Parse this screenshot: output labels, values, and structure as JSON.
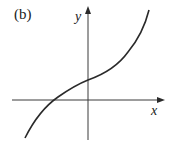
{
  "figure": {
    "panel_label": "(b)",
    "axes": {
      "x_label": "x",
      "y_label": "y"
    },
    "colors": {
      "curve": "#2a2a2a",
      "axis": "#3a3a3a",
      "background": "#ffffff"
    },
    "curve": {
      "description": "monotonically increasing cubic-like curve crossing negative x-axis and positive y-intercept",
      "points_px": [
        [
          25,
          138
        ],
        [
          55,
          100
        ],
        [
          88,
          80
        ],
        [
          125,
          55
        ],
        [
          149,
          10
        ]
      ]
    }
  }
}
